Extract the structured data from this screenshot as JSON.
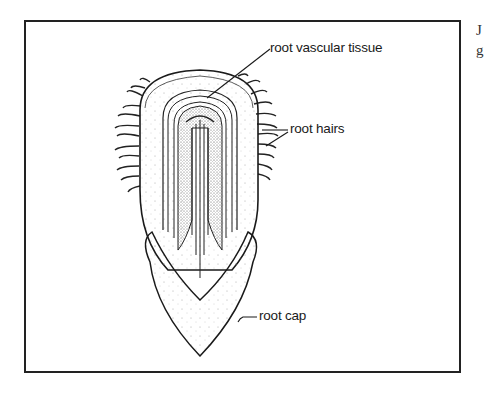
{
  "diagram": {
    "labels": {
      "vascular": "root vascular tissue",
      "hairs": "root hairs",
      "cap": "root cap"
    },
    "side_text": {
      "line1": "J",
      "line2": "g"
    },
    "colors": {
      "line": "#1a1a1a",
      "stipple": "#888888",
      "background": "#ffffff"
    }
  }
}
